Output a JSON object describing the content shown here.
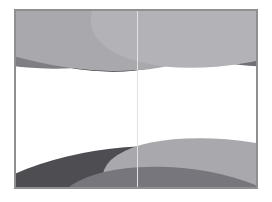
{
  "canvas": {
    "width": 272,
    "height": 202,
    "background_color": "#ffffff",
    "description": "Abstract grayscale graphic of overlapping tilted elliptical bands"
  },
  "panel": {
    "left": 14,
    "top": 9,
    "width": 244,
    "height": 180,
    "fill_color": "#ffffff",
    "border_color": "#8f8f8f",
    "border_width": 1
  },
  "center_divider": {
    "x": 122,
    "color": "#e2e2e2",
    "width": 1
  },
  "palette": {
    "near_black": "#2b2b2b",
    "dark_gray": "#55555a",
    "mid_gray": "#7e7e83",
    "light_gray": "#a8a8ad",
    "pale_gray": "#bdbdc2",
    "white": "#ffffff"
  },
  "shapes": [
    {
      "name": "top-dark-band",
      "layer": 1,
      "color": "#2b2b2b",
      "left": -96,
      "top": -104,
      "width": 300,
      "height": 160,
      "rotate": 14
    },
    {
      "name": "top-mid-band-left",
      "layer": 2,
      "color": "#7e7e83",
      "left": -70,
      "top": -66,
      "width": 330,
      "height": 120,
      "rotate": -9
    },
    {
      "name": "top-mid-band-right",
      "layer": 3,
      "color": "#6f6f75",
      "left": 60,
      "top": -88,
      "width": 300,
      "height": 140,
      "rotate": 11
    },
    {
      "name": "top-light-band-left",
      "layer": 4,
      "color": "#a8a8ad",
      "left": -102,
      "top": -56,
      "width": 300,
      "height": 112,
      "rotate": 10
    },
    {
      "name": "top-light-band-right",
      "layer": 5,
      "color": "#b2b2b7",
      "left": 74,
      "top": -74,
      "width": 290,
      "height": 128,
      "rotate": -10
    },
    {
      "name": "bottom-dark-band",
      "layer": 6,
      "color": "#4d4d52",
      "left": -60,
      "top": 140,
      "width": 300,
      "height": 120,
      "rotate": -9
    },
    {
      "name": "bottom-near-black-band",
      "layer": 7,
      "color": "#2f2f33",
      "left": 12,
      "top": 162,
      "width": 280,
      "height": 110,
      "rotate": -5
    },
    {
      "name": "bottom-light-band",
      "layer": 8,
      "color": "#a8a8ad",
      "left": 86,
      "top": 132,
      "width": 290,
      "height": 110,
      "rotate": 9
    },
    {
      "name": "bottom-mid-band",
      "layer": 9,
      "color": "#76767c",
      "left": 40,
      "top": 158,
      "width": 250,
      "height": 104,
      "rotate": 6
    }
  ]
}
